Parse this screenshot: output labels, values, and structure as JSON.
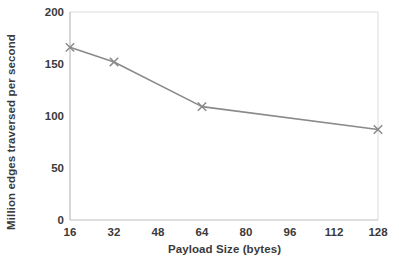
{
  "chart_data": {
    "type": "line",
    "title": "",
    "subtitle": "",
    "xlabel": "Payload Size (bytes)",
    "ylabel": "Million edges traversed per second",
    "x": [
      16,
      32,
      64,
      128
    ],
    "values": [
      166,
      152,
      109,
      87
    ],
    "series": [
      {
        "name": "",
        "x": [
          16,
          32,
          64,
          128
        ],
        "values": [
          166,
          152,
          109,
          87
        ]
      }
    ],
    "xlim": [
      16,
      128
    ],
    "ylim": [
      0,
      200
    ],
    "xticks": [
      16,
      32,
      48,
      64,
      80,
      96,
      112,
      128
    ],
    "yticks": [
      0,
      50,
      100,
      150,
      200
    ],
    "xtick_labels": [
      "16",
      "32",
      "48",
      "64",
      "80",
      "96",
      "112",
      "128"
    ],
    "ytick_labels": [
      "0",
      "50",
      "100",
      "150",
      "200"
    ],
    "grid": false,
    "legend": null,
    "marker": "x",
    "annotations": [],
    "colors": {
      "line": "#8a8a8a",
      "marker": "#8a8a8a",
      "axis": "#b8b8b8",
      "frame": "#d8d8d8",
      "text": "#3a3a3a",
      "background": "#ffffff"
    }
  },
  "axes": {
    "x_title": "Payload Size (bytes)",
    "y_title": "Million edges traversed per second"
  }
}
